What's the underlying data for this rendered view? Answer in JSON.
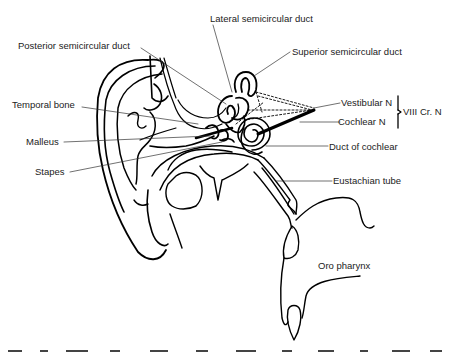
{
  "figure": {
    "labels": {
      "lateral_semicircular_duct": "Lateral semicircular duct",
      "posterior_semicircular_duct": "Posterior semicircular duct",
      "superior_semicircular_duct": "Superior semicircular duct",
      "temporal_bone": "Temporal bone",
      "vestibular_n": "Vestibular N",
      "cochlear_n": "Cochlear N",
      "viii_cr_n": "VIII Cr. N",
      "malleus": "Malleus",
      "duct_of_cochlear": "Duct of cochlear",
      "stapes": "Stapes",
      "eustachian_tube": "Eustachian tube",
      "oro_pharynx": "Oro pharynx"
    },
    "colors": {
      "line": "#000000",
      "text": "#222222",
      "background": "#ffffff"
    }
  }
}
